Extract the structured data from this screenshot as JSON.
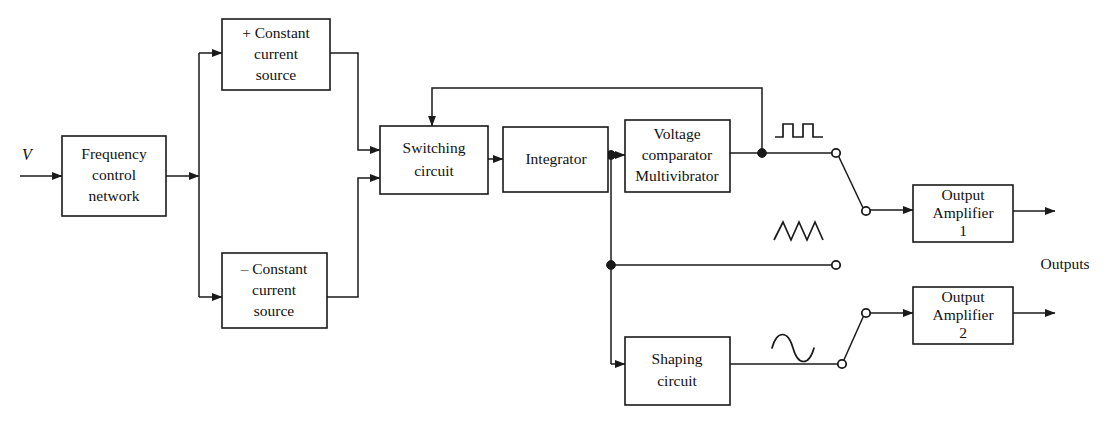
{
  "diagram": {
    "stroke_color": "#1a1a1a",
    "background_color": "#ffffff",
    "input_label": "V",
    "output_group_label": "Outputs",
    "blocks": {
      "frequency_control": {
        "line1": "Frequency",
        "line2": "control",
        "line3": "network"
      },
      "positive_source": {
        "line1": "+ Constant",
        "line2": "current",
        "line3": "source"
      },
      "negative_source": {
        "line1": "– Constant",
        "line2": "current",
        "line3": "source"
      },
      "switching_circuit": {
        "line1": "Switching",
        "line2": "circuit"
      },
      "integrator": {
        "line1": "Integrator"
      },
      "comparator": {
        "line1": "Voltage",
        "line2": "comparator",
        "line3": "Multivibrator"
      },
      "shaping_circuit": {
        "line1": "Shaping",
        "line2": "circuit"
      },
      "output_amp_1": {
        "line1": "Output",
        "line2": "Amplifier",
        "line3": "1"
      },
      "output_amp_2": {
        "line1": "Output",
        "line2": "Amplifier",
        "line3": "2"
      }
    },
    "waveforms": [
      {
        "name": "square-wave-icon",
        "kind": "square"
      },
      {
        "name": "triangle-wave-icon",
        "kind": "triangle"
      },
      {
        "name": "sine-wave-icon",
        "kind": "sine"
      }
    ],
    "switch_terminals": [
      {
        "name": "switch-terminal-square"
      },
      {
        "name": "switch-terminal-triangle-upper"
      },
      {
        "name": "switch-pole-amplifier-1"
      },
      {
        "name": "switch-terminal-triangle-lower"
      },
      {
        "name": "switch-pole-amplifier-2"
      },
      {
        "name": "switch-terminal-sine"
      }
    ]
  }
}
